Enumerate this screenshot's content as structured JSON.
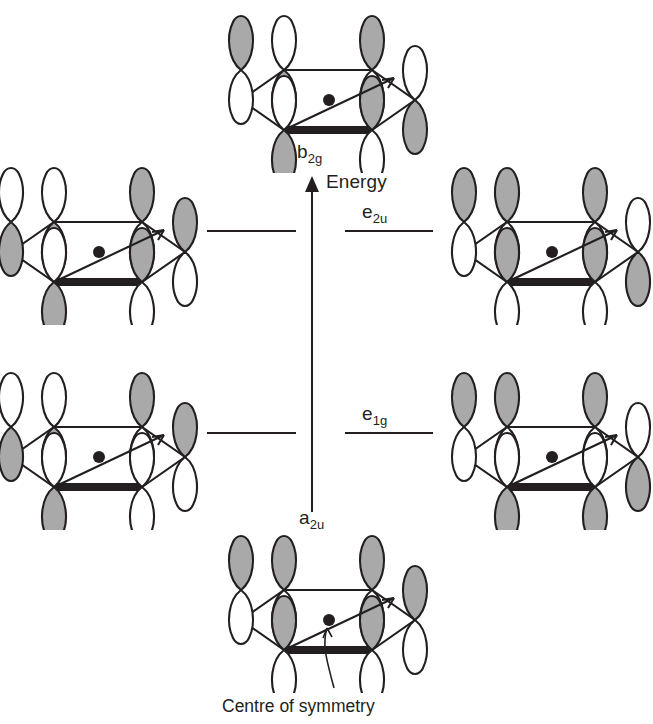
{
  "diagram": {
    "title_visible": false,
    "background_color": "#ffffff",
    "ink_color": "#231f20",
    "lobe_shaded_color": "#a9a9a9",
    "lobe_empty_color": "#ffffff"
  },
  "energy_axis": {
    "label": "Energy",
    "direction": "up",
    "x": 312,
    "y_top": 178,
    "y_bottom": 512,
    "label_x": 326,
    "label_y": 178
  },
  "levels": [
    {
      "name": "b2g",
      "label": "b",
      "sub": "2g",
      "label_x": 297,
      "label_y": 145,
      "orbital_count": 1,
      "degenerate": false,
      "lines": []
    },
    {
      "name": "e2u",
      "label": "e",
      "sub": "2u",
      "label_x": 362,
      "label_y": 205,
      "orbital_count": 2,
      "degenerate": true,
      "lines": [
        {
          "x1": 207,
          "x2": 296,
          "y": 231
        },
        {
          "x1": 345,
          "x2": 433,
          "y": 231
        }
      ]
    },
    {
      "name": "e1g",
      "label": "e",
      "sub": "1g",
      "label_x": 362,
      "label_y": 407,
      "orbital_count": 2,
      "degenerate": true,
      "lines": [
        {
          "x1": 207,
          "x2": 296,
          "y": 433
        },
        {
          "x1": 345,
          "x2": 433,
          "y": 433
        }
      ]
    },
    {
      "name": "a2u",
      "label": "a",
      "sub": "2u",
      "label_x": 299,
      "label_y": 512,
      "orbital_count": 1,
      "degenerate": false,
      "lines": []
    }
  ],
  "orbitals": [
    {
      "id": "b2g-top",
      "level": "b2g",
      "position": {
        "left": 222,
        "top": 8
      },
      "description": "antibonding, phases alternate at every ring atom",
      "top_lobe_shaded": [
        true,
        false,
        true,
        false,
        true,
        false
      ]
    },
    {
      "id": "e2u-left",
      "level": "e2u",
      "position": {
        "left": -8,
        "top": 160
      },
      "description": "antibonding pair member, two nodal planes",
      "top_lobe_shaded": [
        false,
        false,
        true,
        true,
        true,
        false
      ]
    },
    {
      "id": "e2u-right",
      "level": "e2u",
      "position": {
        "left": 445,
        "top": 160
      },
      "description": "antibonding pair member, two nodal planes",
      "top_lobe_shaded": [
        true,
        true,
        true,
        false,
        false,
        true
      ]
    },
    {
      "id": "e1g-left",
      "level": "e1g",
      "position": {
        "left": -8,
        "top": 365
      },
      "description": "bonding pair member, one nodal plane",
      "top_lobe_shaded": [
        false,
        false,
        false,
        true,
        true,
        true
      ]
    },
    {
      "id": "e1g-right",
      "level": "e1g",
      "position": {
        "left": 445,
        "top": 365
      },
      "description": "bonding pair member, one nodal plane",
      "top_lobe_shaded": [
        true,
        true,
        false,
        false,
        true,
        true
      ]
    },
    {
      "id": "a2u-bottom",
      "level": "a2u",
      "position": {
        "left": 222,
        "top": 528
      },
      "description": "fully bonding, all top lobes in phase",
      "top_lobe_shaded": [
        true,
        true,
        true,
        true,
        true,
        true
      ]
    }
  ],
  "annotation": {
    "text": "Centre of symmetry",
    "x": 330,
    "y": 706,
    "pointer": "curved leader line from caption up to the central dot of the a2u orbital"
  }
}
